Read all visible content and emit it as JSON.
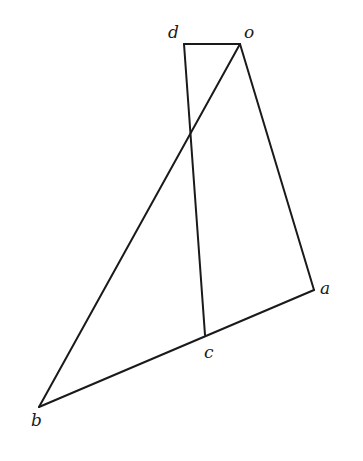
{
  "diagram": {
    "type": "geometric-figure",
    "points": {
      "o": {
        "label": "o",
        "x": 240,
        "y": 44,
        "label_x": 244,
        "label_y": 38
      },
      "d": {
        "label": "d",
        "x": 184,
        "y": 44,
        "label_x": 168,
        "label_y": 38
      },
      "a": {
        "label": "a",
        "x": 314,
        "y": 290,
        "label_x": 320,
        "label_y": 294
      },
      "c": {
        "label": "c",
        "x": 205,
        "y": 335,
        "label_x": 204,
        "label_y": 358
      },
      "b": {
        "label": "b",
        "x": 39,
        "y": 407,
        "label_x": 31,
        "label_y": 426
      }
    },
    "segments": [
      {
        "name": "d-o",
        "from": "d",
        "to": "o"
      },
      {
        "name": "o-a",
        "from": "o",
        "to": "a"
      },
      {
        "name": "o-b",
        "from": "o",
        "to": "b"
      },
      {
        "name": "d-c",
        "from": "d",
        "to": "c"
      },
      {
        "name": "b-a",
        "from": "b",
        "to": "a"
      }
    ],
    "colors": {
      "line": "#1a1a1a",
      "background": "#ffffff"
    }
  }
}
